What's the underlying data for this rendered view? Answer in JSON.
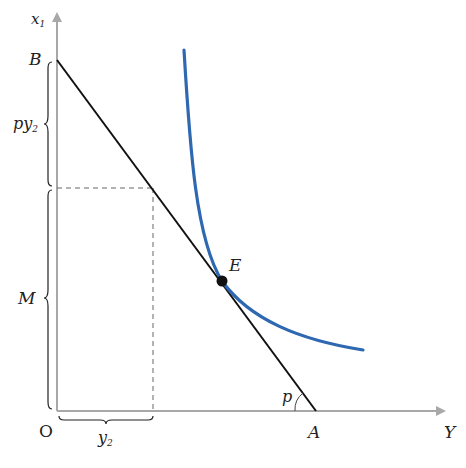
{
  "diagram": {
    "axes": {
      "y_label": "x",
      "y_label_sub": "1",
      "x_label": "Y",
      "origin_label": "O"
    },
    "points": {
      "B": "B",
      "A": "A",
      "E": "E"
    },
    "angle_label": "p",
    "braces": {
      "upper_left": {
        "text": "py",
        "sub": "2"
      },
      "lower_left": {
        "text": "M"
      },
      "bottom": {
        "text": "y",
        "sub": "2"
      }
    },
    "colors": {
      "axis": "#a8a8a8",
      "budget_line": "#111111",
      "indifference_curve": "#2e68b0",
      "dashed": "#666666"
    }
  }
}
